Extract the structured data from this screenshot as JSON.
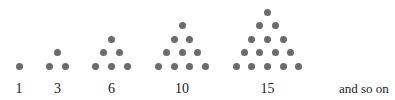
{
  "dot_color": "#6b6b6b",
  "figures": [
    {
      "label": "1",
      "rows": 1,
      "center_x": 19
    },
    {
      "label": "3",
      "rows": 2,
      "center_x": 57.5
    },
    {
      "label": "6",
      "rows": 3,
      "center_x": 111.5
    },
    {
      "label": "10",
      "rows": 4,
      "center_x": 182
    },
    {
      "label": "15",
      "rows": 5,
      "center_x": 267.5
    }
  ],
  "trailing_text": "and so on",
  "layout": {
    "row_spacing": 13.5,
    "dot_spacing": 15.6,
    "bottom_row_y": 66
  }
}
